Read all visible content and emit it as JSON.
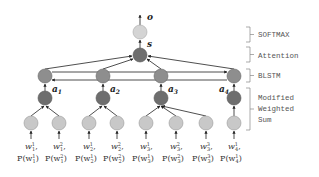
{
  "diagram": {
    "output_label": "o",
    "state_label": "s",
    "layers": [
      {
        "name": "softmax",
        "label": "SOFTMAX"
      },
      {
        "name": "attention",
        "label": "Attention"
      },
      {
        "name": "blstm",
        "label": "BLSTM"
      },
      {
        "name": "weighted_sum",
        "label_lines": [
          "Modified",
          "Weighted",
          "Sum"
        ]
      }
    ],
    "word_vectors": [
      {
        "label": "a",
        "sub": "1"
      },
      {
        "label": "a",
        "sub": "2"
      },
      {
        "label": "a",
        "sub": "3"
      },
      {
        "label": "a",
        "sub": "4"
      }
    ],
    "inputs": [
      {
        "word": "w",
        "sub": "1",
        "sup": "1",
        "prob": "P(w",
        "prob_sub": "1",
        "prob_sup": "1"
      },
      {
        "word": "w",
        "sub": "1",
        "sup": "2",
        "prob": "P(w",
        "prob_sub": "1",
        "prob_sup": "2"
      },
      {
        "word": "w",
        "sub": "2",
        "sup": "1",
        "prob": "P(w",
        "prob_sub": "2",
        "prob_sup": "1"
      },
      {
        "word": "w",
        "sub": "2",
        "sup": "2",
        "prob": "P(w",
        "prob_sub": "2",
        "prob_sup": "2"
      },
      {
        "word": "w",
        "sub": "3",
        "sup": "1",
        "prob": "P(w",
        "prob_sub": "3",
        "prob_sup": "1"
      },
      {
        "word": "w",
        "sub": "3",
        "sup": "2",
        "prob": "P(w",
        "prob_sub": "3",
        "prob_sup": "2"
      },
      {
        "word": "w",
        "sub": "3",
        "sup": "3",
        "prob": "P(w",
        "prob_sub": "3",
        "prob_sup": "3"
      },
      {
        "word": "w",
        "sub": "4",
        "sup": "1",
        "prob": "P(w",
        "prob_sub": "4",
        "prob_sup": "1"
      }
    ],
    "colors": {
      "light_node": "#c8c8c8",
      "dark_node": "#7a7a7a",
      "mid_node": "#8e8e8e",
      "edge": "#222222",
      "bracket": "#888888"
    }
  }
}
